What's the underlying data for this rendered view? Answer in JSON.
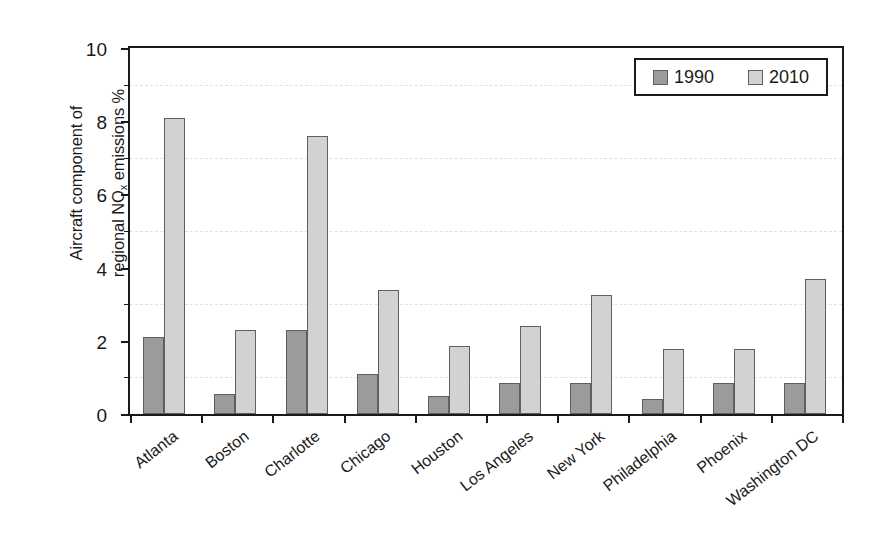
{
  "chart_data": {
    "type": "bar",
    "title": "",
    "xlabel": "",
    "ylabel": "Aircraft component of regional NOx emissions %",
    "ylabel_line1": "Aircraft component of",
    "ylabel_line2_pre": "regional NO",
    "ylabel_line2_sub": "x",
    "ylabel_line2_post": " emissions %",
    "ylim": [
      0,
      10
    ],
    "ytick_labels": [
      "0",
      "2",
      "4",
      "6",
      "8",
      "10"
    ],
    "ytick_values": [
      0,
      2,
      4,
      6,
      8,
      10
    ],
    "minor_tick_values": [
      1,
      3,
      5,
      7,
      9
    ],
    "grid": "horizontal-dashed-minor",
    "legend_position": "top-right",
    "categories": [
      "Atlanta",
      "Boston",
      "Charlotte",
      "Chicago",
      "Houston",
      "Los Angeles",
      "New York",
      "Philadelphia",
      "Phoenix",
      "Washington DC"
    ],
    "series": [
      {
        "name": "1990",
        "color": "#9b9b9b",
        "values": [
          2.1,
          0.55,
          2.3,
          1.1,
          0.5,
          0.85,
          0.85,
          0.4,
          0.85,
          0.85
        ]
      },
      {
        "name": "2010",
        "color": "#d2d2d2",
        "values": [
          8.1,
          2.3,
          7.6,
          3.4,
          1.85,
          2.4,
          3.25,
          1.78,
          1.78,
          3.68
        ]
      }
    ]
  },
  "legend": {
    "entries": [
      {
        "label": "1990",
        "color": "#9b9b9b"
      },
      {
        "label": "2010",
        "color": "#d2d2d2"
      }
    ]
  },
  "colors": {
    "series_1990": "#9b9b9b",
    "series_2010": "#d2d2d2",
    "axis": "#1a1a1a",
    "grid": "#e2e2e2",
    "background": "#ffffff"
  }
}
